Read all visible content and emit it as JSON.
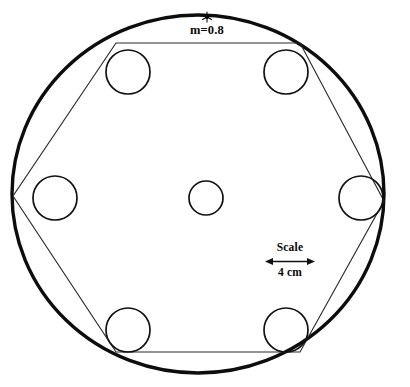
{
  "figure": {
    "name": "hexagonal-ring-configuration-diagram",
    "background_color": "#ffffff",
    "ink_color": "#0d0d0d",
    "annotations": {
      "mass_ratio_label": "m=0.8",
      "star_marker_name": "asterisk-marker",
      "scale_title": "Scale",
      "scale_value": "4 cm"
    },
    "geometry": {
      "outer_ring": {
        "cx": 198,
        "cy": 194,
        "rx": 186,
        "ry": 179,
        "stroke_width": 3.4
      },
      "center_body": {
        "cx": 206,
        "cy": 198,
        "r": 17
      },
      "satellite_radius": 22,
      "satellites": [
        {
          "name": "satellite-top-left",
          "cx": 128,
          "cy": 72
        },
        {
          "name": "satellite-top-right",
          "cx": 286,
          "cy": 72
        },
        {
          "name": "satellite-right",
          "cx": 361,
          "cy": 198
        },
        {
          "name": "satellite-bottom-right",
          "cx": 286,
          "cy": 330
        },
        {
          "name": "satellite-bottom-left",
          "cx": 128,
          "cy": 330
        },
        {
          "name": "satellite-left",
          "cx": 55,
          "cy": 198
        }
      ],
      "hexagon_vertices": [
        {
          "x": 116,
          "y": 43
        },
        {
          "x": 300,
          "y": 43
        },
        {
          "x": 384,
          "y": 201
        },
        {
          "x": 300,
          "y": 352
        },
        {
          "x": 116,
          "y": 352
        },
        {
          "x": 13,
          "y": 196
        }
      ],
      "star_marker": {
        "cx": 207,
        "cy": 17,
        "r": 5
      },
      "scale_bar": {
        "x1": 267,
        "x2": 313,
        "y": 261,
        "title_x": 290,
        "title_y": 252,
        "value_x": 290,
        "value_y": 276
      }
    }
  }
}
